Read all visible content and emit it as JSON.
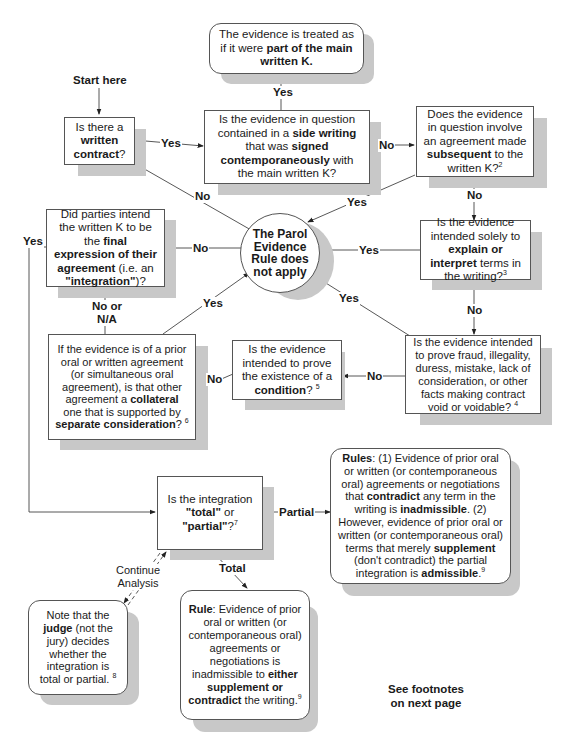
{
  "start_label": "Start here",
  "nodes": {
    "written_contract": {
      "pre": "Is there a ",
      "bold": "written contract",
      "post": "?"
    },
    "side_writing": {
      "parts": [
        {
          "t": "Is the evidence in question contained in a ",
          "b": false
        },
        {
          "t": "side writing",
          "b": true
        },
        {
          "t": " that was ",
          "b": false
        },
        {
          "t": "signed contemporaneously",
          "b": true
        },
        {
          "t": " with the main written K?",
          "b": false
        }
      ]
    },
    "part_of_main": {
      "parts": [
        {
          "t": "The evidence is treated as if it were ",
          "b": false
        },
        {
          "t": "part of the main written K.",
          "b": true
        }
      ]
    },
    "subsequent": {
      "parts": [
        {
          "t": "Does the evidence in question involve an agreement made ",
          "b": false
        },
        {
          "t": "subsequent",
          "b": true
        },
        {
          "t": " to the written K?",
          "b": false
        },
        {
          "t": "2",
          "b": false,
          "sup": true
        }
      ]
    },
    "parol_rule": {
      "text": "The Parol Evidence Rule does not apply"
    },
    "final_expression": {
      "parts": [
        {
          "t": "Did parties intend the written K to be the ",
          "b": false
        },
        {
          "t": "final expression of their agreement",
          "b": true
        },
        {
          "t": " (i.e. an ",
          "b": false
        },
        {
          "t": "\"integration\"",
          "b": true
        },
        {
          "t": ")?",
          "b": false
        }
      ]
    },
    "explain": {
      "parts": [
        {
          "t": "Is the evidence intended solely to ",
          "b": false
        },
        {
          "t": "explain or interpret",
          "b": true
        },
        {
          "t": " terms in the writing?",
          "b": false
        },
        {
          "t": "3",
          "b": false,
          "sup": true
        }
      ]
    },
    "fraud": {
      "parts": [
        {
          "t": "Is the evidence intended to prove fraud, illegality, duress, mistake, lack of consideration, or other facts making contract void or voidable? ",
          "b": false
        },
        {
          "t": "4",
          "b": false,
          "sup": true
        }
      ]
    },
    "condition": {
      "parts": [
        {
          "t": "Is the evidence intended to prove the existence of a ",
          "b": false
        },
        {
          "t": "condition",
          "b": true
        },
        {
          "t": "? ",
          "b": false
        },
        {
          "t": "5",
          "b": false,
          "sup": true
        }
      ]
    },
    "collateral": {
      "parts": [
        {
          "t": "If the evidence is of a prior oral or written agreement (or simultaneous oral agreement), is that other agreement a ",
          "b": false
        },
        {
          "t": "collateral",
          "b": true
        },
        {
          "t": " one that is supported by ",
          "b": false
        },
        {
          "t": "separate consideration",
          "b": true
        },
        {
          "t": "? ",
          "b": false
        },
        {
          "t": "6",
          "b": false,
          "sup": true
        }
      ]
    },
    "total_partial": {
      "parts": [
        {
          "t": "Is the integration ",
          "b": false
        },
        {
          "t": "\"total\"",
          "b": true
        },
        {
          "t": " or ",
          "b": false
        },
        {
          "t": "\"partial\"",
          "b": true
        },
        {
          "t": "?",
          "b": false
        },
        {
          "t": "7",
          "b": false,
          "sup": true
        }
      ]
    },
    "rules_partial": {
      "parts": [
        {
          "t": "Rules",
          "b": true
        },
        {
          "t": ": (1) Evidence of prior oral or written (or contemporaneous oral) agreements or negotiations that ",
          "b": false
        },
        {
          "t": "contradict",
          "b": true
        },
        {
          "t": "  any term in the writing is ",
          "b": false
        },
        {
          "t": "inadmissible",
          "b": true
        },
        {
          "t": ". (2) However, evidence of prior oral or written (or contemporaneous oral) terms that merely ",
          "b": false
        },
        {
          "t": "supplement",
          "b": true
        },
        {
          "t": "  (don't contradict) the partial integration is ",
          "b": false
        },
        {
          "t": "admissible",
          "b": true
        },
        {
          "t": ".",
          "b": false
        },
        {
          "t": "9",
          "b": false,
          "sup": true
        }
      ]
    },
    "rule_total": {
      "parts": [
        {
          "t": "Rule",
          "b": true
        },
        {
          "t": ": Evidence of prior oral or written (or contemporaneous oral) agreements or negotiations is inadmissible to ",
          "b": false
        },
        {
          "t": "either supplement or contradict",
          "b": true
        },
        {
          "t": " the writing.",
          "b": false
        },
        {
          "t": "9",
          "b": false,
          "sup": true
        }
      ]
    },
    "judge_note": {
      "parts": [
        {
          "t": "Note that the ",
          "b": false
        },
        {
          "t": "judge",
          "b": true
        },
        {
          "t": " (not the jury) decides whether the integration is total or partial. ",
          "b": false
        },
        {
          "t": "8",
          "b": false,
          "sup": true
        }
      ]
    }
  },
  "edge_labels": {
    "wc_yes": "Yes",
    "wc_no": "No",
    "side_yes": "Yes",
    "side_no": "No",
    "sub_yes": "Yes",
    "sub_no": "No",
    "final_no": "No",
    "final_yes": "Yes",
    "explain_yes": "Yes",
    "explain_no": "No",
    "fraud_yes": "Yes",
    "fraud_no": "No",
    "cond_no": "No",
    "collateral_yes": "Yes",
    "collateral_no": "No or N/A",
    "partial": "Partial",
    "total": "Total",
    "continue": "Continue Analysis"
  },
  "footnote_text": "See footnotes on next page"
}
